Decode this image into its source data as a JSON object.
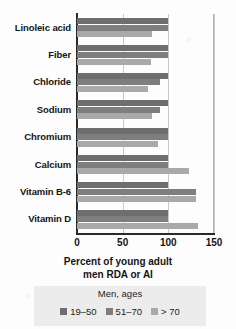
{
  "chart_data": {
    "type": "bar",
    "orientation": "horizontal",
    "title": "",
    "xlabel": "Percent of young adult men RDA or AI",
    "xlabel_line1": "Percent of young adult",
    "xlabel_line2": "men RDA or AI",
    "ylabel": "",
    "xlim": [
      0,
      150
    ],
    "xticks": [
      0,
      50,
      100,
      150
    ],
    "xtick_labels": [
      "0",
      "50",
      "100",
      "150"
    ],
    "grid": true,
    "legend_position": "bottom",
    "legend_title": "Men, ages",
    "categories": [
      "Linoleic acid",
      "Fiber",
      "Chloride",
      "Sodium",
      "Chromium",
      "Calcium",
      "Vitamin B-6",
      "Vitamin D"
    ],
    "series": [
      {
        "name": "19–50",
        "color": "#6e6e6e",
        "values": [
          100,
          100,
          100,
          100,
          100,
          100,
          100,
          100
        ]
      },
      {
        "name": "51–70",
        "color": "#7e7e7e",
        "values": [
          100,
          100,
          91,
          91,
          100,
          100,
          130,
          100
        ]
      },
      {
        "name": "> 70",
        "color": "#a9a9a9",
        "values": [
          82,
          81,
          78,
          82,
          89,
          123,
          130,
          133
        ]
      }
    ]
  },
  "colors": {
    "series_19_50": "#6e6e6e",
    "series_51_70": "#7e7e7e",
    "series_over_70": "#a9a9a9",
    "axis": "#2a2a2a",
    "grid": "#c9c9c9",
    "legend_background": "#ececec",
    "text": "#141414",
    "page_background": "#fdfdfd"
  }
}
